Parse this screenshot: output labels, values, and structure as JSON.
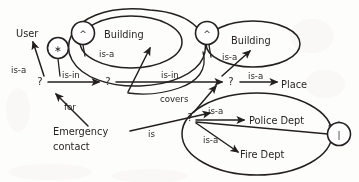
{
  "diagram": {
    "stroke_color": "#231f20",
    "background_color": "#fdfdfc",
    "entities": [
      {
        "id": "user",
        "label": "User",
        "x": 30,
        "y": 34
      },
      {
        "id": "building_l",
        "label": "Building",
        "x": 121,
        "y": 35
      },
      {
        "id": "building_r",
        "label": "Building",
        "x": 248,
        "y": 41
      },
      {
        "id": "place",
        "label": "Place",
        "x": 285,
        "y": 85
      },
      {
        "id": "police",
        "label": "Police Dept",
        "x": 278,
        "y": 121
      },
      {
        "id": "fire",
        "label": "Fire Dept",
        "x": 272,
        "y": 160
      },
      {
        "id": "emergency",
        "label": "Emergency",
        "x": 96,
        "y": 132
      },
      {
        "id": "contact",
        "label": "contact",
        "x": 89,
        "y": 147
      }
    ],
    "variable_nodes": [
      {
        "id": "q1",
        "label": "?",
        "x": 40,
        "y": 82
      },
      {
        "id": "q2",
        "label": "?",
        "x": 108,
        "y": 82
      },
      {
        "id": "q3",
        "label": "?",
        "x": 231,
        "y": 82
      },
      {
        "id": "q4",
        "label": "?",
        "x": 190,
        "y": 118
      }
    ],
    "glyph_nodes": [
      {
        "id": "n-star",
        "glyph": "∗",
        "name": "asterisk-node",
        "cx": 58,
        "cy": 48,
        "r": 10.5
      },
      {
        "id": "n-caret-l",
        "glyph": "^",
        "name": "caret-node-left",
        "cx": 83,
        "cy": 33,
        "r": 11.5
      },
      {
        "id": "n-caret-r",
        "glyph": "^",
        "name": "caret-node-right",
        "cx": 207,
        "cy": 33,
        "r": 11.5
      },
      {
        "id": "n-bar",
        "glyph": "|",
        "name": "bar-node-right",
        "cx": 339,
        "cy": 134,
        "r": 11.5
      }
    ],
    "relations": [
      {
        "id": "r1",
        "label": "is-a",
        "x": 19,
        "y": 70,
        "from": "q1",
        "to": "user"
      },
      {
        "id": "r2",
        "label": "is-in",
        "x": 75,
        "y": 76,
        "from": "q1",
        "to": "q2"
      },
      {
        "id": "r3",
        "label": "is-a",
        "x": 105,
        "y": 54,
        "from": "q2",
        "to": "building_l"
      },
      {
        "id": "r4",
        "label": "is-in",
        "x": 172,
        "y": 76,
        "from": "q2",
        "to": "q3"
      },
      {
        "id": "r5",
        "label": "is-a",
        "x": 229,
        "y": 57,
        "from": "q3",
        "to": "building_r"
      },
      {
        "id": "r6",
        "label": "is-a",
        "x": 254,
        "y": 78,
        "from": "q3",
        "to": "place"
      },
      {
        "id": "r7",
        "label": "covers",
        "x": 173,
        "y": 98,
        "from": "q4",
        "to": "q3"
      },
      {
        "id": "r8",
        "label": "for",
        "x": 70,
        "y": 105,
        "from": "emergency",
        "to": "q1"
      },
      {
        "id": "r9",
        "label": "is",
        "x": 150,
        "y": 133,
        "from": "emergency",
        "to": "q4"
      },
      {
        "id": "r10",
        "label": "is-a",
        "x": 219,
        "y": 111,
        "from": "q4",
        "to": "police"
      },
      {
        "id": "r11",
        "label": "is-a",
        "x": 212,
        "y": 139,
        "from": "q4",
        "to": "fire"
      }
    ],
    "groups": [
      {
        "id": "g-left-inner",
        "name": "building-left-group",
        "cx": 131,
        "cy": 42,
        "rx": 51,
        "ry": 27
      },
      {
        "id": "g-left-outer",
        "name": "left-outer-group",
        "cx": 139,
        "cy": 52,
        "rx": 66,
        "ry": 42
      },
      {
        "id": "g-right-inner",
        "name": "building-right-group",
        "cx": 253,
        "cy": 44,
        "rx": 47,
        "ry": 24
      },
      {
        "id": "g-dept",
        "name": "departments-group",
        "cx": 257,
        "cy": 134,
        "rx": 75,
        "ry": 42
      }
    ]
  }
}
